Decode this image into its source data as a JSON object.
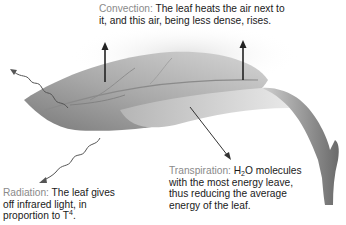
{
  "diagram": {
    "colors": {
      "leaf_dark": "#6e6e6e",
      "leaf_light": "#cfcfcf",
      "arrow": "#222222",
      "wave": "#555555",
      "term_label": "#8a8a8a",
      "text": "#1a1a1a",
      "air_haze": "#e4e4e4"
    },
    "convection": {
      "term": "Convection:",
      "line1": "The leaf heats the air next to",
      "line2": "it, and this air, being less dense, rises."
    },
    "radiation": {
      "term": "Radiation:",
      "line1": "The leaf gives",
      "line2": "off infrared light, in",
      "line3_prefix": "proportion to T",
      "line3_sup": "4",
      "line3_suffix": "."
    },
    "transpiration": {
      "term": "Transpiration:",
      "line1_h": "H",
      "line1_sub": "2",
      "line1_rest": "O molecules",
      "line2": "with the most energy leave,",
      "line3": "thus reducing the average",
      "line4": "energy of the leaf."
    }
  }
}
